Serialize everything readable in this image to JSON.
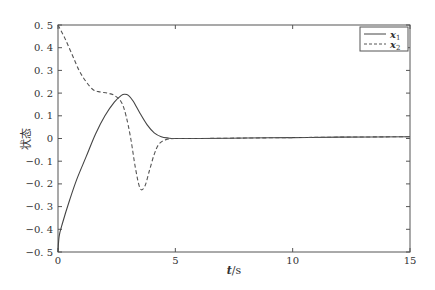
{
  "chart_data": {
    "type": "line",
    "title": "",
    "xlabel": "t/s",
    "ylabel": "状态",
    "xlim": [
      0,
      15
    ],
    "ylim": [
      -0.5,
      0.5
    ],
    "xticks": [
      0,
      5,
      10,
      15
    ],
    "xtick_labels": [
      "0",
      "5",
      "10",
      "15"
    ],
    "yticks": [
      0.5,
      0.4,
      0.3,
      0.2,
      0.1,
      0,
      -0.1,
      -0.2,
      -0.3,
      -0.4,
      -0.5
    ],
    "ytick_labels": [
      "0. 5",
      "0. 4",
      "0. 3",
      "0. 2",
      "0. 1",
      "0",
      "−0. 1",
      "−0. 2",
      "−0. 3",
      "−0. 4",
      "−0. 5"
    ],
    "grid": false,
    "legend_position": "upper right",
    "series": [
      {
        "name": "x1",
        "label_main": "x",
        "label_sub": "1",
        "style": "solid",
        "color": "#444444",
        "x": [
          0,
          0.05,
          0.2,
          0.5,
          0.8,
          1.2,
          1.6,
          2.0,
          2.4,
          2.7,
          2.85,
          3.0,
          3.2,
          3.5,
          3.8,
          4.1,
          4.4,
          4.7,
          5.0,
          6,
          8,
          10,
          12,
          15
        ],
        "y": [
          -0.5,
          -0.43,
          -0.37,
          -0.27,
          -0.18,
          -0.08,
          0.02,
          0.1,
          0.16,
          0.19,
          0.195,
          0.19,
          0.165,
          0.11,
          0.06,
          0.025,
          0.008,
          0.002,
          0.0,
          0.0,
          0.002,
          0.004,
          0.006,
          0.008
        ]
      },
      {
        "name": "x2",
        "label_main": "x",
        "label_sub": "2",
        "style": "dashed",
        "color": "#555555",
        "x": [
          0,
          0.3,
          0.6,
          0.9,
          1.2,
          1.5,
          1.8,
          2.1,
          2.4,
          2.7,
          2.9,
          3.1,
          3.3,
          3.5,
          3.7,
          3.9,
          4.1,
          4.3,
          4.6,
          5.0,
          6,
          8,
          10,
          12,
          15
        ],
        "y": [
          0.5,
          0.44,
          0.37,
          0.3,
          0.25,
          0.215,
          0.205,
          0.2,
          0.19,
          0.16,
          0.1,
          0.0,
          -0.13,
          -0.22,
          -0.21,
          -0.14,
          -0.07,
          -0.025,
          -0.005,
          0.0,
          0.0,
          0.002,
          0.004,
          0.006,
          0.008
        ]
      }
    ]
  }
}
